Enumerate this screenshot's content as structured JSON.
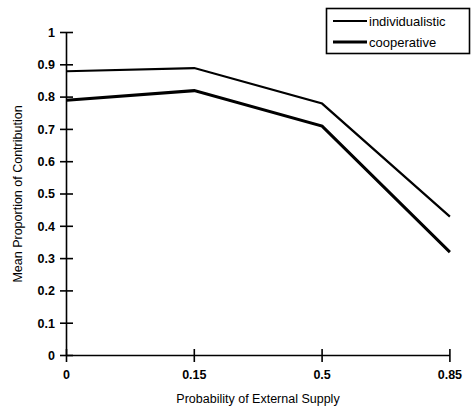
{
  "chart_data": {
    "type": "line",
    "title": "",
    "xlabel": "Probability of External Supply",
    "ylabel": "Mean Proportion of Contribution",
    "categories": [
      "0",
      "0.15",
      "0.5",
      "0.85"
    ],
    "x": [
      0,
      0.15,
      0.5,
      0.85
    ],
    "series": [
      {
        "name": "individualistic",
        "values": [
          0.88,
          0.89,
          0.78,
          0.43
        ],
        "color": "#000000",
        "line_width": 2.2
      },
      {
        "name": "cooperative",
        "values": [
          0.79,
          0.82,
          0.71,
          0.32
        ],
        "color": "#000000",
        "line_width": 3.0
      }
    ],
    "ylim": [
      0,
      1
    ],
    "ytick_labels": [
      "0",
      "0.1",
      "0.2",
      "0.3",
      "0.4",
      "0.5",
      "0.6",
      "0.7",
      "0.8",
      "0.9",
      "1"
    ],
    "ytick_values": [
      0,
      0.1,
      0.2,
      0.3,
      0.4,
      0.5,
      0.6,
      0.7,
      0.8,
      0.9,
      1
    ],
    "xtick_labels": [
      "0",
      "0.15",
      "0.5",
      "0.85"
    ],
    "grid": false,
    "legend_position": "top-right",
    "background_color": "#ffffff",
    "axis_color": "#000000"
  },
  "legend": {
    "entries": [
      {
        "label": "individualistic"
      },
      {
        "label": "cooperative"
      }
    ]
  },
  "axes": {
    "y_title": "Mean Proportion of Contribution",
    "x_title": "Probability of External Supply"
  }
}
